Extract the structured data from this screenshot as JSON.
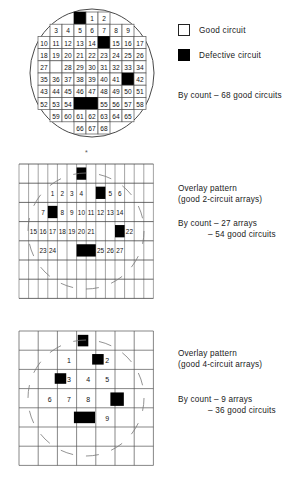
{
  "figure": {
    "title_hidden": "",
    "panels": [
      {
        "id": "panel-wafer",
        "name": "wafer-map-individual-circuits",
        "legend": {
          "good_label": "Good circuit",
          "defective_label": "Defective circuit",
          "good_color": "#ffffff",
          "defective_color": "#000000"
        },
        "count_note": "By count – 68 good circuits",
        "grid": {
          "cols": 9,
          "rows": 10,
          "cell_w": 12,
          "cell_h": 12.2
        },
        "cells": [
          {
            "r": 0,
            "c": 3,
            "state": "defect",
            "label": ""
          },
          {
            "r": 0,
            "c": 4,
            "state": "good",
            "label": "1"
          },
          {
            "r": 0,
            "c": 5,
            "state": "good",
            "label": "2"
          },
          {
            "r": 1,
            "c": 1,
            "state": "good",
            "label": "3"
          },
          {
            "r": 1,
            "c": 2,
            "state": "good",
            "label": "4"
          },
          {
            "r": 1,
            "c": 3,
            "state": "good",
            "label": "5"
          },
          {
            "r": 1,
            "c": 4,
            "state": "good",
            "label": "6"
          },
          {
            "r": 1,
            "c": 5,
            "state": "good",
            "label": "7"
          },
          {
            "r": 1,
            "c": 6,
            "state": "good",
            "label": "8"
          },
          {
            "r": 1,
            "c": 7,
            "state": "good",
            "label": "9"
          },
          {
            "r": 2,
            "c": 0,
            "state": "good",
            "label": "10"
          },
          {
            "r": 2,
            "c": 1,
            "state": "good",
            "label": "11"
          },
          {
            "r": 2,
            "c": 2,
            "state": "good",
            "label": "12"
          },
          {
            "r": 2,
            "c": 3,
            "state": "good",
            "label": "13"
          },
          {
            "r": 2,
            "c": 4,
            "state": "good",
            "label": "14"
          },
          {
            "r": 2,
            "c": 5,
            "state": "defect",
            "label": ""
          },
          {
            "r": 2,
            "c": 6,
            "state": "good",
            "label": "15"
          },
          {
            "r": 2,
            "c": 7,
            "state": "good",
            "label": "16"
          },
          {
            "r": 2,
            "c": 8,
            "state": "good",
            "label": "17"
          },
          {
            "r": 3,
            "c": 0,
            "state": "good",
            "label": "18"
          },
          {
            "r": 3,
            "c": 1,
            "state": "good",
            "label": "19"
          },
          {
            "r": 3,
            "c": 2,
            "state": "good",
            "label": "20"
          },
          {
            "r": 3,
            "c": 3,
            "state": "good",
            "label": "21"
          },
          {
            "r": 3,
            "c": 4,
            "state": "good",
            "label": "22"
          },
          {
            "r": 3,
            "c": 5,
            "state": "good",
            "label": "23"
          },
          {
            "r": 3,
            "c": 6,
            "state": "good",
            "label": "24"
          },
          {
            "r": 3,
            "c": 7,
            "state": "good",
            "label": "25"
          },
          {
            "r": 3,
            "c": 8,
            "state": "good",
            "label": "26"
          },
          {
            "r": 4,
            "c": 0,
            "state": "good",
            "label": "27"
          },
          {
            "r": 4,
            "c": 1,
            "state": "blank",
            "label": ""
          },
          {
            "r": 4,
            "c": 2,
            "state": "good",
            "label": "28"
          },
          {
            "r": 4,
            "c": 3,
            "state": "good",
            "label": "29"
          },
          {
            "r": 4,
            "c": 4,
            "state": "good",
            "label": "30"
          },
          {
            "r": 4,
            "c": 5,
            "state": "good",
            "label": "31"
          },
          {
            "r": 4,
            "c": 6,
            "state": "good",
            "label": "32"
          },
          {
            "r": 4,
            "c": 7,
            "state": "good",
            "label": "33"
          },
          {
            "r": 4,
            "c": 8,
            "state": "good",
            "label": "34"
          },
          {
            "r": 5,
            "c": 0,
            "state": "good",
            "label": "35"
          },
          {
            "r": 5,
            "c": 1,
            "state": "good",
            "label": "36"
          },
          {
            "r": 5,
            "c": 2,
            "state": "good",
            "label": "37"
          },
          {
            "r": 5,
            "c": 3,
            "state": "good",
            "label": "38"
          },
          {
            "r": 5,
            "c": 4,
            "state": "good",
            "label": "39"
          },
          {
            "r": 5,
            "c": 5,
            "state": "good",
            "label": "40"
          },
          {
            "r": 5,
            "c": 6,
            "state": "good",
            "label": "41"
          },
          {
            "r": 5,
            "c": 7,
            "state": "defect",
            "label": ""
          },
          {
            "r": 5,
            "c": 8,
            "state": "good",
            "label": "42"
          },
          {
            "r": 6,
            "c": 0,
            "state": "good",
            "label": "43"
          },
          {
            "r": 6,
            "c": 1,
            "state": "good",
            "label": "44"
          },
          {
            "r": 6,
            "c": 2,
            "state": "good",
            "label": "45"
          },
          {
            "r": 6,
            "c": 3,
            "state": "good",
            "label": "46"
          },
          {
            "r": 6,
            "c": 4,
            "state": "good",
            "label": "47"
          },
          {
            "r": 6,
            "c": 5,
            "state": "good",
            "label": "48"
          },
          {
            "r": 6,
            "c": 6,
            "state": "good",
            "label": "49"
          },
          {
            "r": 6,
            "c": 7,
            "state": "good",
            "label": "50"
          },
          {
            "r": 6,
            "c": 8,
            "state": "good",
            "label": "51"
          },
          {
            "r": 7,
            "c": 0,
            "state": "good",
            "label": "52"
          },
          {
            "r": 7,
            "c": 1,
            "state": "good",
            "label": "53"
          },
          {
            "r": 7,
            "c": 2,
            "state": "good",
            "label": "54"
          },
          {
            "r": 7,
            "c": 3,
            "state": "defect",
            "label": ""
          },
          {
            "r": 7,
            "c": 4,
            "state": "defect",
            "label": ""
          },
          {
            "r": 7,
            "c": 5,
            "state": "good",
            "label": "55"
          },
          {
            "r": 7,
            "c": 6,
            "state": "good",
            "label": "56"
          },
          {
            "r": 7,
            "c": 7,
            "state": "good",
            "label": "57"
          },
          {
            "r": 7,
            "c": 8,
            "state": "good",
            "label": "58"
          },
          {
            "r": 8,
            "c": 1,
            "state": "good",
            "label": "59"
          },
          {
            "r": 8,
            "c": 2,
            "state": "good",
            "label": "60"
          },
          {
            "r": 8,
            "c": 3,
            "state": "good",
            "label": "61"
          },
          {
            "r": 8,
            "c": 4,
            "state": "good",
            "label": "62"
          },
          {
            "r": 8,
            "c": 5,
            "state": "good",
            "label": "63"
          },
          {
            "r": 8,
            "c": 6,
            "state": "good",
            "label": "64"
          },
          {
            "r": 8,
            "c": 7,
            "state": "good",
            "label": "65"
          },
          {
            "r": 9,
            "c": 3,
            "state": "good",
            "label": "66"
          },
          {
            "r": 9,
            "c": 4,
            "state": "good",
            "label": "67"
          },
          {
            "r": 9,
            "c": 5,
            "state": "good",
            "label": "68"
          }
        ]
      },
      {
        "id": "panel-overlay-2",
        "name": "overlay-pattern-2-circuit-arrays",
        "heading_line1": "Overlay pattern",
        "heading_line2": "(good 2-circuit arrays)",
        "count_line1": "By count – 27 arrays",
        "count_line2": "– 54 good circuits",
        "grid": {
          "cols": 14,
          "rows": 7,
          "cell_w": 9.6,
          "cell_h": 19.2
        },
        "defects": [
          {
            "r": 0,
            "c": 6,
            "w": 1,
            "h": 1
          },
          {
            "r": 1,
            "c": 8,
            "w": 1,
            "h": 1
          },
          {
            "r": 2,
            "c": 3,
            "w": 1,
            "h": 1
          },
          {
            "r": 3,
            "c": 10,
            "w": 1,
            "h": 1
          },
          {
            "r": 4,
            "c": 6,
            "w": 2,
            "h": 1
          }
        ],
        "labels": [
          {
            "r": 1,
            "c": 3,
            "text": "1"
          },
          {
            "r": 1,
            "c": 4,
            "text": "2"
          },
          {
            "r": 1,
            "c": 5,
            "text": "3"
          },
          {
            "r": 1,
            "c": 6,
            "text": "4"
          },
          {
            "r": 1,
            "c": 9,
            "text": "5"
          },
          {
            "r": 1,
            "c": 10,
            "text": "6"
          },
          {
            "r": 2,
            "c": 2,
            "text": "7"
          },
          {
            "r": 2,
            "c": 4,
            "text": "8"
          },
          {
            "r": 2,
            "c": 5,
            "text": "9"
          },
          {
            "r": 2,
            "c": 6,
            "text": "10"
          },
          {
            "r": 2,
            "c": 7,
            "text": "11"
          },
          {
            "r": 2,
            "c": 8,
            "text": "12"
          },
          {
            "r": 2,
            "c": 9,
            "text": "13"
          },
          {
            "r": 2,
            "c": 10,
            "text": "14"
          },
          {
            "r": 3,
            "c": 1,
            "text": "15"
          },
          {
            "r": 3,
            "c": 2,
            "text": "16"
          },
          {
            "r": 3,
            "c": 3,
            "text": "17"
          },
          {
            "r": 3,
            "c": 4,
            "text": "18"
          },
          {
            "r": 3,
            "c": 5,
            "text": "19"
          },
          {
            "r": 3,
            "c": 6,
            "text": "20"
          },
          {
            "r": 3,
            "c": 7,
            "text": "21"
          },
          {
            "r": 3,
            "c": 11,
            "text": "22"
          },
          {
            "r": 4,
            "c": 2,
            "text": "23"
          },
          {
            "r": 4,
            "c": 3,
            "text": "24"
          },
          {
            "r": 4,
            "c": 8,
            "text": "25"
          },
          {
            "r": 4,
            "c": 9,
            "text": "26"
          },
          {
            "r": 4,
            "c": 10,
            "text": "27"
          }
        ]
      },
      {
        "id": "panel-overlay-4",
        "name": "overlay-pattern-4-circuit-arrays",
        "heading_line1": "Overlay pattern",
        "heading_line2": "(good 4-circuit arrays)",
        "count_line1": "By count – 9 arrays",
        "count_line2": "– 36 good circuits",
        "grid": {
          "cols": 7,
          "rows": 7,
          "cell_w": 19.2,
          "cell_h": 19.2
        },
        "defects": [
          {
            "r": 0,
            "c": 3,
            "w": 0.55,
            "h": 0.6
          },
          {
            "r": 1,
            "c": 3.75,
            "w": 0.6,
            "h": 0.55
          },
          {
            "r": 2,
            "c": 1.8,
            "w": 0.6,
            "h": 0.55
          },
          {
            "r": 3,
            "c": 4.7,
            "w": 0.7,
            "h": 0.7
          },
          {
            "r": 4,
            "c": 2.8,
            "w": 1.1,
            "h": 0.6
          }
        ],
        "labels": [
          {
            "r": 1,
            "c": 2.6,
            "text": "1"
          },
          {
            "r": 1,
            "c": 4.6,
            "text": "2"
          },
          {
            "r": 2,
            "c": 2.6,
            "text": "3"
          },
          {
            "r": 2,
            "c": 3.6,
            "text": "4"
          },
          {
            "r": 2,
            "c": 4.6,
            "text": "5"
          },
          {
            "r": 3,
            "c": 1.6,
            "text": "6"
          },
          {
            "r": 3,
            "c": 2.6,
            "text": "7"
          },
          {
            "r": 3,
            "c": 3.6,
            "text": "8"
          },
          {
            "r": 4,
            "c": 4.6,
            "text": "9"
          }
        ]
      }
    ]
  }
}
